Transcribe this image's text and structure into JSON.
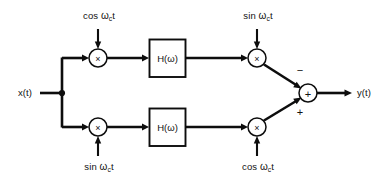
{
  "diagram": {
    "type": "signal-flow-block-diagram",
    "width": 388,
    "height": 182,
    "background_color": "#ffffff",
    "line_color": "#0d0d0d",
    "input": {
      "label": "x(t)",
      "name": "input-signal"
    },
    "output": {
      "label": "y(t)",
      "name": "output-signal"
    },
    "branch_point": {
      "name": "input-split-junction"
    },
    "upper_path": {
      "input_multiplier": {
        "symbol": "×",
        "name": "upper-input-multiplier"
      },
      "input_carrier": {
        "prefix": "cos",
        "omega": "ω",
        "subscript": "c",
        "suffix": "t",
        "full": "cos ωc t",
        "position": "above"
      },
      "filter": {
        "label": "H(ω)",
        "name": "upper-filter-block"
      },
      "output_multiplier": {
        "symbol": "×",
        "name": "upper-output-multiplier"
      },
      "output_carrier": {
        "prefix": "sin",
        "omega": "ω",
        "subscript": "c",
        "suffix": "t",
        "full": "sin ωc t",
        "position": "above"
      },
      "adder_sign": "−"
    },
    "lower_path": {
      "input_multiplier": {
        "symbol": "×",
        "name": "lower-input-multiplier"
      },
      "input_carrier": {
        "prefix": "sin",
        "omega": "ω",
        "subscript": "c",
        "suffix": "t",
        "full": "sin ωc t",
        "position": "below"
      },
      "filter": {
        "label": "H(ω)",
        "name": "lower-filter-block"
      },
      "output_multiplier": {
        "symbol": "×",
        "name": "lower-output-multiplier"
      },
      "output_carrier": {
        "prefix": "cos",
        "omega": "ω",
        "subscript": "c",
        "suffix": "t",
        "full": "cos ωc t",
        "position": "below"
      },
      "adder_sign": "+"
    },
    "summing_node": {
      "symbol": "+",
      "name": "summing-junction"
    }
  }
}
